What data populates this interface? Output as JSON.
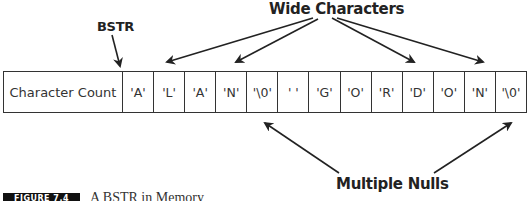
{
  "labels": {
    "bstr": "BSTR",
    "wide_characters": "Wide Characters",
    "multiple_nulls": "Multiple Nulls"
  },
  "memory": {
    "count_cell": "Character Count",
    "cells": [
      "'A'",
      "'L'",
      "'A'",
      "'N'",
      "'\\0'",
      "' '",
      "'G'",
      "'O'",
      "'R'",
      "'D'",
      "'O'",
      "'N'",
      "'\\0'"
    ]
  },
  "caption": {
    "figure_number": "FIGURE 7.4",
    "title": "A BSTR in Memory"
  },
  "colors": {
    "line": "#222222",
    "caption_box": "#111111",
    "background": "#ffffff"
  }
}
